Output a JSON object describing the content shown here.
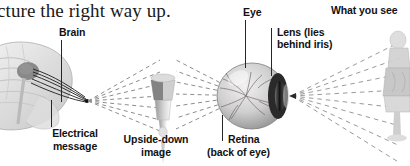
{
  "page": {
    "width": 410,
    "height": 166,
    "background": "#ffffff",
    "text_color": "#111111",
    "ray_color": "#8a8a8a",
    "figure_gray": "#b9b9b9",
    "figure_dark": "#3a3a3a"
  },
  "body_text": {
    "top_left_fragment": "cture the right way up."
  },
  "labels": {
    "what_you_see": "What you see",
    "brain": "Brain",
    "eye": "Eye",
    "lens_line1": "Lens (lies",
    "lens_line2": "behind iris)",
    "electrical_line1": "Electrical",
    "electrical_line2": "message",
    "upside_down_line1": "Upside-down",
    "upside_down_line2": "image",
    "retina_line1": "Retina",
    "retina_line2": "(back of eye)"
  },
  "figures": {
    "brain": "brain-illustration",
    "optic_nerve": "optic-nerve-lines",
    "upside_down_image": "inverted-figure-illustration",
    "eyeball": "eyeball-illustration",
    "lens": "lens-iris-shape",
    "retina_vessels": "retina-blood-vessels",
    "what_you_see_figure": "upright-figure-illustration",
    "rays_brain_to_image": "dashed-light-rays",
    "rays_image_to_eye": "dashed-light-rays",
    "rays_eye_to_object": "dashed-light-rays"
  }
}
